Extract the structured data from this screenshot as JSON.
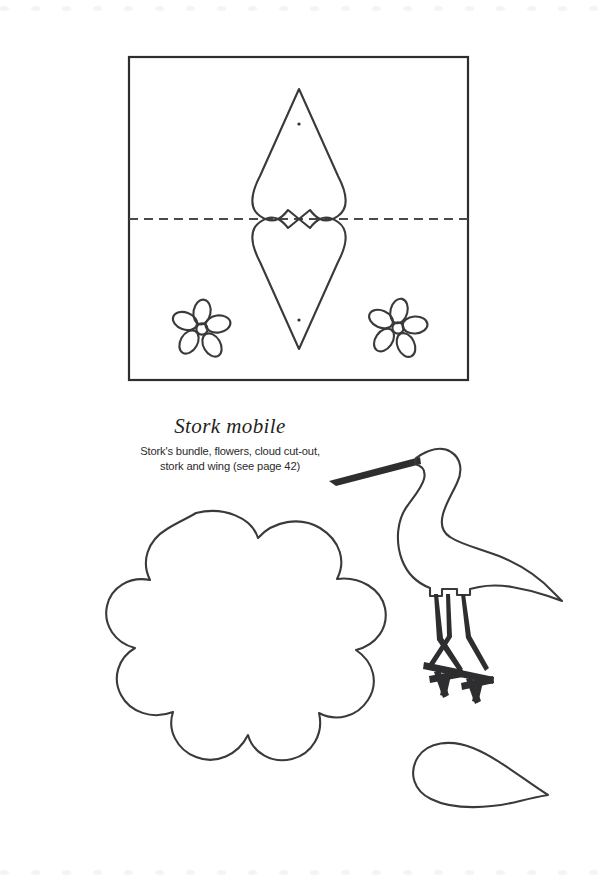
{
  "page": {
    "width": 606,
    "height": 880,
    "background": "#ffffff",
    "ink_color": "#3a3a3c",
    "dot_color": "#f4f4f6"
  },
  "decoration": {
    "top_dot_rail_count": 20,
    "bottom_dot_rail_count": 20
  },
  "title": {
    "heading": "Stork mobile",
    "subtitle_line_1": "Stork's bundle, flowers, cloud cut-out,",
    "subtitle_line_2": "stork and wing (see page 42)",
    "page_reference": "see page 42"
  },
  "template_frame": {
    "label": "stork-bundle-template",
    "x": 129,
    "y": 57,
    "width": 339,
    "height": 323,
    "fold_line": {
      "label": "fold line",
      "style": "dashed",
      "y": 219,
      "x_start": 129,
      "x_end": 468
    }
  },
  "pieces": [
    {
      "name": "bundle",
      "label": "Stork's bundle",
      "punch_holes": 2
    },
    {
      "name": "flower-left",
      "label": "Flower",
      "petals": 5
    },
    {
      "name": "flower-right",
      "label": "Flower",
      "petals": 5
    },
    {
      "name": "cloud",
      "label": "Cloud cut-out",
      "scallops": 10
    },
    {
      "name": "stork",
      "label": "Stork"
    },
    {
      "name": "wing",
      "label": "Wing"
    }
  ]
}
